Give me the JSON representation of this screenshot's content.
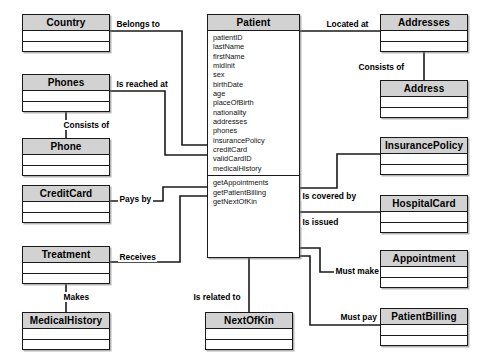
{
  "diagram": {
    "type": "uml-class-diagram",
    "colors": {
      "header_fill": "#d2d2d2",
      "body_fill": "#ffffff",
      "stroke": "#1a1a1a",
      "background": "#ffffff"
    }
  },
  "classes": [
    {
      "id": "country",
      "name": "Country",
      "x": 22,
      "y": 14,
      "w": 88,
      "h": 38,
      "attributes": [],
      "operations": []
    },
    {
      "id": "phones",
      "name": "Phones",
      "x": 22,
      "y": 74,
      "w": 88,
      "h": 38,
      "attributes": [],
      "operations": []
    },
    {
      "id": "phone",
      "name": "Phone",
      "x": 22,
      "y": 138,
      "w": 88,
      "h": 38,
      "attributes": [],
      "operations": []
    },
    {
      "id": "creditcard",
      "name": "CreditCard",
      "x": 22,
      "y": 185,
      "w": 88,
      "h": 38,
      "attributes": [],
      "operations": []
    },
    {
      "id": "treatment",
      "name": "Treatment",
      "x": 22,
      "y": 246,
      "w": 88,
      "h": 38,
      "attributes": [],
      "operations": []
    },
    {
      "id": "medicalhistory",
      "name": "MedicalHistory",
      "x": 22,
      "y": 312,
      "w": 88,
      "h": 38,
      "attributes": [],
      "operations": []
    },
    {
      "id": "patient",
      "name": "Patient",
      "x": 207,
      "y": 14,
      "w": 93,
      "h": 244,
      "attributes": [
        "patientID",
        "lastName",
        "firstName",
        "midInit",
        "sex",
        "birthDate",
        "age",
        "placeOfBirth",
        "nationality",
        "addresses",
        "phones",
        "insurancePolicy",
        "creditCard",
        "validCardID",
        "medicalHistory"
      ],
      "operations": [
        "getAppointments",
        "getPatientBilling",
        "getNextOfKin"
      ]
    },
    {
      "id": "addresses",
      "name": "Addresses",
      "x": 380,
      "y": 14,
      "w": 88,
      "h": 38,
      "attributes": [],
      "operations": []
    },
    {
      "id": "address",
      "name": "Address",
      "x": 380,
      "y": 80,
      "w": 88,
      "h": 38,
      "attributes": [],
      "operations": []
    },
    {
      "id": "insurancepolicy",
      "name": "InsurancePolicy",
      "x": 380,
      "y": 137,
      "w": 88,
      "h": 38,
      "attributes": [],
      "operations": []
    },
    {
      "id": "hospitalcard",
      "name": "HospitalCard",
      "x": 380,
      "y": 195,
      "w": 88,
      "h": 38,
      "attributes": [],
      "operations": []
    },
    {
      "id": "appointment",
      "name": "Appointment",
      "x": 380,
      "y": 250,
      "w": 88,
      "h": 38,
      "attributes": [],
      "operations": []
    },
    {
      "id": "patientbilling",
      "name": "PatientBilling",
      "x": 380,
      "y": 308,
      "w": 88,
      "h": 38,
      "attributes": [],
      "operations": []
    },
    {
      "id": "nextofkin",
      "name": "NextOfKin",
      "x": 205,
      "y": 312,
      "w": 88,
      "h": 38,
      "attributes": [],
      "operations": []
    }
  ],
  "relationships": [
    {
      "id": "belongs-to",
      "label": "Belongs to",
      "from": "country",
      "to": "patient",
      "label_x": 115,
      "label_y": 19,
      "path": "M 110,31 L 182,31 L 182,145 L 207,145"
    },
    {
      "id": "is-reached-at",
      "label": "Is reached at",
      "from": "phones",
      "to": "patient",
      "label_x": 115,
      "label_y": 79,
      "path": "M 110,91 L 165,91 L 165,155 L 207,155"
    },
    {
      "id": "consists-of-phones",
      "label": "Consists of",
      "from": "phones",
      "to": "phone",
      "label_x": 62,
      "label_y": 120,
      "path": "M 66,112 L 66,138"
    },
    {
      "id": "pays-by",
      "label": "Pays by",
      "from": "creditcard",
      "to": "patient",
      "label_x": 118,
      "label_y": 194,
      "path": "M 110,201 L 163,201 L 163,187 L 207,187"
    },
    {
      "id": "receives",
      "label": "Receives",
      "from": "treatment",
      "to": "patient",
      "label_x": 118,
      "label_y": 252,
      "path": "M 110,262 L 180,262 L 180,196 L 207,196"
    },
    {
      "id": "makes",
      "label": "Makes",
      "from": "treatment",
      "to": "medicalhistory",
      "label_x": 62,
      "label_y": 292,
      "path": "M 66,284 L 66,312"
    },
    {
      "id": "located-at",
      "label": "Located at",
      "from": "patient",
      "to": "addresses",
      "label_x": 325,
      "label_y": 19,
      "path": "M 300,31 L 380,31"
    },
    {
      "id": "consists-of-addresses",
      "label": "Consists of",
      "from": "addresses",
      "to": "address",
      "label_x": 357,
      "label_y": 62,
      "path": "M 424,52 L 424,80"
    },
    {
      "id": "is-covered-by",
      "label": "Is covered by",
      "from": "patient",
      "to": "insurancepolicy",
      "label_x": 301,
      "label_y": 191,
      "path": "M 300,188 L 337,188 L 337,154 L 380,154"
    },
    {
      "id": "is-issued",
      "label": "Is issued",
      "from": "patient",
      "to": "hospitalcard",
      "label_x": 301,
      "label_y": 217,
      "path": "M 300,212 L 350,212 L 350,212 L 380,212"
    },
    {
      "id": "must-make",
      "label": "Must make",
      "from": "patient",
      "to": "appointment",
      "label_x": 334,
      "label_y": 266,
      "path": "M 300,248 L 320,248 L 320,272 L 380,272"
    },
    {
      "id": "must-pay",
      "label": "Must pay",
      "from": "patient",
      "to": "patientbilling",
      "label_x": 339,
      "label_y": 312,
      "path": "M 300,256 L 310,256 L 310,325 L 380,325"
    },
    {
      "id": "is-related-to",
      "label": "Is related to",
      "from": "patient",
      "to": "nextofkin",
      "label_x": 192,
      "label_y": 292,
      "path": "M 249,258 L 249,312"
    }
  ]
}
